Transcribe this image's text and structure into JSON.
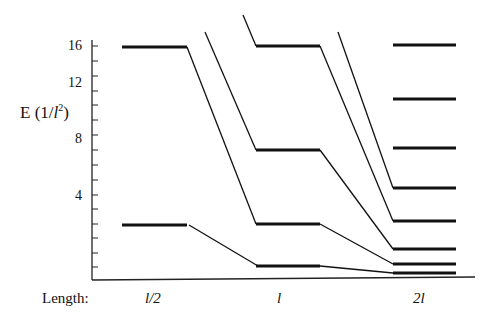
{
  "chart_data": {
    "type": "line",
    "title": "",
    "xlabel": "Length:",
    "ylabel": "E (1/l²)",
    "ylabel_parts": {
      "main": "E (1/",
      "var": "l",
      "sup": "2",
      "close": ")"
    },
    "yticks": [
      {
        "label": "16",
        "y": 47
      },
      {
        "label": "12",
        "y": 84
      },
      {
        "label": "8",
        "y": 140
      },
      {
        "label": "4",
        "y": 197
      }
    ],
    "minor_tick_y": [
      46,
      61,
      76,
      91,
      105,
      120,
      135,
      150,
      165,
      180,
      195,
      209,
      224,
      238,
      253,
      267
    ],
    "categories": [
      "l/2",
      "l",
      "2l"
    ],
    "category_x": [
      155,
      287,
      423
    ],
    "levels_px": {
      "l/2": [
        47,
        225
      ],
      "l": [
        46,
        150,
        224,
        266
      ],
      "2l": [
        45,
        99,
        148,
        188,
        221,
        249,
        264,
        273
      ]
    },
    "levels_energy_units_of_1_over_l2": {
      "l/2": [
        16,
        4
      ],
      "l": [
        16,
        9,
        4,
        1
      ],
      "2l": [
        16,
        12.25,
        9,
        6.25,
        4,
        2.25,
        1,
        0.25
      ]
    },
    "note": "Particle-in-a-box energy levels vs box length; levels connected by lines as length increases"
  }
}
